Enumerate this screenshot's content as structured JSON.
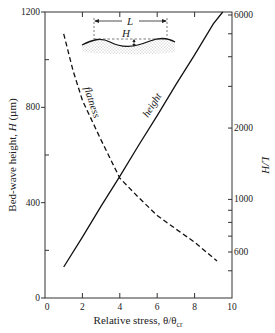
{
  "chart_data": {
    "type": "line",
    "title": "",
    "xlabel": "Relative stress, θ/θcr",
    "xlabel_main": "Relative stress, θ/θ",
    "xlabel_sub": "cr",
    "ylabel": "Bed-wave height, H (µm)",
    "ylabel_prefix": "Bed-wave height, ",
    "ylabel_var": "H",
    "ylabel_unit": " (µm)",
    "y2label": "L/H",
    "xlim": [
      0,
      10
    ],
    "ylim": [
      0,
      1200
    ],
    "y2lim": [
      400,
      6000
    ],
    "y2scale": "log",
    "x_ticks": [
      0,
      2,
      4,
      6,
      8,
      10
    ],
    "x_tick_labels": [
      "0",
      "2",
      "4",
      "6",
      "8",
      "10"
    ],
    "y_ticks_major": [
      0,
      400,
      800,
      1200
    ],
    "y_tick_labels": [
      "0",
      "400",
      "800",
      "1200"
    ],
    "y_ticks_minor": [
      200,
      600,
      1000
    ],
    "y2_ticks_major": [
      600,
      1000,
      2000,
      6000
    ],
    "y2_tick_labels": [
      "600",
      "1000",
      "2000",
      "6000"
    ],
    "y2_ticks_minor": [
      500,
      700,
      800,
      900,
      3000,
      4000,
      5000
    ],
    "grid": false,
    "legend": "none (curves labeled inline)",
    "series": [
      {
        "name": "height",
        "axis": "left",
        "style": "solid",
        "x": [
          1.0,
          2.0,
          3.0,
          4.0,
          5.0,
          6.0,
          7.0,
          8.0,
          9.0,
          9.5
        ],
        "values": [
          130,
          255,
          385,
          510,
          640,
          765,
          895,
          1020,
          1150,
          1200
        ]
      },
      {
        "name": "flatness",
        "axis": "right",
        "style": "dashed",
        "x": [
          1.0,
          1.5,
          2.0,
          3.0,
          4.0,
          5.0,
          6.0,
          7.0,
          8.0,
          9.2
        ],
        "values": [
          5000,
          3500,
          2620,
          1780,
          1230,
          1020,
          855,
          750,
          660,
          550
        ]
      }
    ],
    "annotations": [
      {
        "text": "height",
        "type": "curve-label"
      },
      {
        "text": "flatness",
        "type": "curve-label"
      },
      {
        "text": "L",
        "type": "inset: bed-wave wavelength"
      },
      {
        "text": "H",
        "type": "inset: bed-wave height"
      }
    ]
  },
  "labels": {
    "height": "height",
    "flatness": "flatness",
    "inset_L": "L",
    "inset_H": "H"
  }
}
